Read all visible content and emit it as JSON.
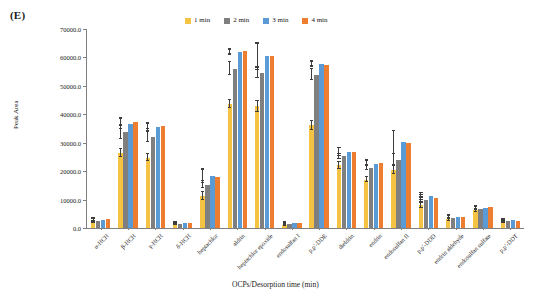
{
  "panel": {
    "label": "(E)"
  },
  "legend": {
    "position": "top-center",
    "entries": [
      {
        "label": "1 min",
        "color": "#f5c344"
      },
      {
        "label": "2 min",
        "color": "#7f7f7f"
      },
      {
        "label": "3 min",
        "color": "#5b9bd5"
      },
      {
        "label": "4 min",
        "color": "#ed7d31"
      }
    ]
  },
  "chart_data": {
    "type": "bar",
    "title": "",
    "subtitle": "",
    "xlabel": "OCPs/Desorption time (min)",
    "ylabel": "Peak Area",
    "ylim": [
      0,
      70000
    ],
    "ytick_labels": [
      "0.0",
      "10000.0",
      "20000.0",
      "30000.0",
      "40000.0",
      "50000.0",
      "60000.0",
      "70000.0"
    ],
    "ytick_values": [
      0,
      10000,
      20000,
      30000,
      40000,
      50000,
      60000,
      70000
    ],
    "grid": false,
    "legend_position": "top-center",
    "categories": [
      "α-HCH",
      "β-HCH",
      "γ-HCH",
      "δ-HCH",
      "heptachlor",
      "aldrin",
      "heptachlor epoxide",
      "endosulfan I",
      "p,p'-DDE",
      "dieldrin",
      "endrin",
      "endosulfan II",
      "p,p'-DDD",
      "endrin aldehyde",
      "endosulfan sulfate",
      "p,p'-DDT"
    ],
    "series": [
      {
        "name": "1 min",
        "color": "#f5c344",
        "values": [
          2100,
          26500,
          24800,
          1200,
          11200,
          43500,
          42800,
          900,
          36200,
          22000,
          17000,
          20500,
          8000,
          3000,
          6300,
          2200
        ],
        "errors": [
          400,
          1400,
          1200,
          250,
          1300,
          1400,
          1900,
          200,
          1600,
          1100,
          900,
          1600,
          800,
          500,
          500,
          400
        ]
      },
      {
        "name": "2 min",
        "color": "#7f7f7f",
        "values": [
          2600,
          33800,
          32000,
          1500,
          15200,
          56000,
          54700,
          1400,
          54000,
          25200,
          21200,
          23800,
          10000,
          3600,
          6800,
          2500
        ],
        "errors": [
          400,
          2600,
          1600,
          250,
          1300,
          2300,
          1800,
          250,
          2000,
          1000,
          900,
          2100,
          800,
          500,
          500,
          400
        ]
      },
      {
        "name": "3 min",
        "color": "#5b9bd5",
        "values": [
          2900,
          36600,
          35500,
          1700,
          18300,
          61800,
          60500,
          1700,
          57800,
          26800,
          22600,
          30200,
          11300,
          3900,
          7200,
          2700
        ],
        "errors": [
          400,
          1600,
          1200,
          250,
          2300,
          800,
          4200,
          250,
          900,
          1500,
          900,
          4000,
          900,
          600,
          500,
          400
        ]
      },
      {
        "name": "4 min",
        "color": "#ed7d31",
        "values": [
          3000,
          37200,
          35900,
          1800,
          18100,
          62100,
          60400,
          1800,
          57500,
          26700,
          23000,
          30000,
          10600,
          3700,
          7300,
          2400
        ],
        "errors": [
          400,
          1400,
          1100,
          250,
          2200,
          900,
          4700,
          250,
          1000,
          1400,
          800,
          4100,
          900,
          600,
          500,
          400
        ]
      }
    ]
  }
}
